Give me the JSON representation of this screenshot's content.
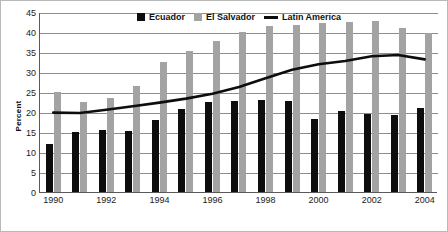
{
  "chart_data": {
    "type": "bar",
    "title": "",
    "xlabel": "",
    "ylabel": "Percent",
    "ylim": [
      0,
      45
    ],
    "ytick_step": 5,
    "yticks": [
      0,
      5,
      10,
      15,
      20,
      25,
      30,
      35,
      40,
      45
    ],
    "grid": true,
    "legend_position": "top-center",
    "categories": [
      1990,
      1991,
      1992,
      1993,
      1994,
      1995,
      1996,
      1997,
      1998,
      1999,
      2000,
      2001,
      2002,
      2003,
      2004
    ],
    "xtick_labels": [
      "1990",
      "",
      "1992",
      "",
      "1994",
      "",
      "1996",
      "",
      "1998",
      "",
      "2000",
      "",
      "2002",
      "",
      "2004"
    ],
    "series": [
      {
        "name": "Ecuador",
        "type": "bar",
        "color": "#0d0d0d",
        "values": [
          12.0,
          15.0,
          15.6,
          15.3,
          17.9,
          20.8,
          22.4,
          22.8,
          22.9,
          22.7,
          18.3,
          20.2,
          19.6,
          19.3,
          21.0
        ]
      },
      {
        "name": "El Salvador",
        "type": "bar",
        "color": "#a3a3a3",
        "values": [
          25.1,
          22.4,
          23.4,
          26.6,
          32.6,
          35.2,
          37.7,
          40.0,
          41.5,
          41.8,
          42.3,
          42.5,
          42.7,
          41.0,
          39.7
        ]
      },
      {
        "name": "Latin America",
        "type": "line",
        "color": "#0d0d0d",
        "values": [
          20.1,
          20.0,
          20.8,
          21.7,
          22.6,
          23.6,
          24.8,
          26.5,
          28.7,
          30.8,
          32.2,
          33.0,
          34.2,
          34.5,
          33.4
        ]
      }
    ]
  },
  "legend": {
    "items": [
      {
        "label": "Ecuador",
        "swatch": "black-square"
      },
      {
        "label": "El Salvador",
        "swatch": "gray-square"
      },
      {
        "label": "Latin America",
        "swatch": "black-line"
      }
    ]
  }
}
